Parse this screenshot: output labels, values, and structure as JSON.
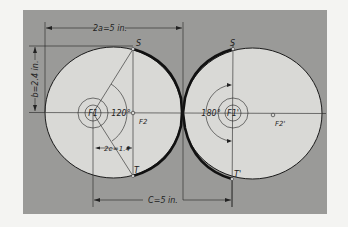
{
  "figure": {
    "colors": {
      "page": "#f4f4f2",
      "panel": "#9a9a98",
      "gear_fill": "#d9d9d6",
      "ink": "#1a1a1a"
    },
    "dimensions": {
      "major_axis": "2a=5 in.",
      "minor_axis": "b=2.4 in.",
      "focal_distance": "2e=1.4",
      "center_distance": "C=5 in."
    },
    "left_gear": {
      "focus_driver": "F1",
      "focus_other": "F2",
      "angle": "120°",
      "point_top": "S",
      "point_bottom": "T"
    },
    "right_gear": {
      "focus_driver": "F1'",
      "focus_other": "F2'",
      "angle": "180°",
      "point_top": "S",
      "point_bottom": "T'"
    }
  }
}
